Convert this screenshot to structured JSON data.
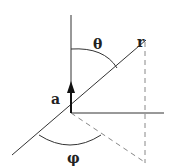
{
  "diagram": {
    "labels": {
      "theta": "θ",
      "phi": "φ",
      "r": "r",
      "a": "a"
    },
    "colors": {
      "line": "#333333",
      "dashed": "#888888",
      "background": "#ffffff"
    }
  }
}
